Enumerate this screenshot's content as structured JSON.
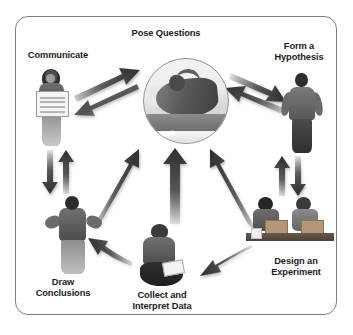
{
  "diagram": {
    "type": "cycle",
    "frame": {
      "border_color": "#7d7f82",
      "background": "#ffffff",
      "corner_radius_px": 13
    },
    "arrow_color": "#3a3a3a",
    "text_color": "#1b1b1b",
    "nodes": [
      {
        "id": "pose-questions",
        "label": "Pose Questions",
        "position": "center",
        "image": "photo-person-reclining-thinking",
        "shape": "circle"
      },
      {
        "id": "communicate",
        "label": "Communicate",
        "position": "left",
        "image": "photo-girl-holding-poster",
        "shape": "cutout"
      },
      {
        "id": "form-a-hypothesis",
        "label": "Form a\nHypothesis",
        "position": "top-right",
        "image": "photo-boy-standing-hands-on-hips",
        "shape": "cutout"
      },
      {
        "id": "design-an-experiment",
        "label": "Design an\nExperiment",
        "position": "bottom-right",
        "image": "photo-two-students-at-lab-bench",
        "shape": "cutout"
      },
      {
        "id": "collect-and-interpret-data",
        "label": "Collect and\nInterpret Data",
        "position": "bottom-center",
        "image": "photo-child-sitting-with-notebook",
        "shape": "cutout"
      },
      {
        "id": "draw-conclusions",
        "label": "Draw\nConclusions",
        "position": "bottom-left",
        "image": "photo-child-shrugging",
        "shape": "cutout"
      }
    ],
    "connections": [
      {
        "from": "communicate",
        "to": "pose-questions",
        "style": "double-headed-diagonal"
      },
      {
        "from": "pose-questions",
        "to": "form-a-hypothesis",
        "style": "double-headed-diagonal"
      },
      {
        "from": "communicate",
        "to": "draw-conclusions",
        "style": "double-headed-vertical"
      },
      {
        "from": "form-a-hypothesis",
        "to": "design-an-experiment",
        "style": "double-headed-vertical"
      },
      {
        "from": "design-an-experiment",
        "to": "collect-and-interpret-data",
        "style": "curved-single"
      },
      {
        "from": "collect-and-interpret-data",
        "to": "draw-conclusions",
        "style": "curved-single"
      },
      {
        "from": "draw-conclusions",
        "to": "pose-questions",
        "style": "straight-single-up"
      },
      {
        "from": "collect-and-interpret-data",
        "to": "pose-questions",
        "style": "straight-single-up"
      },
      {
        "from": "design-an-experiment",
        "to": "pose-questions",
        "style": "straight-single-up"
      }
    ]
  }
}
